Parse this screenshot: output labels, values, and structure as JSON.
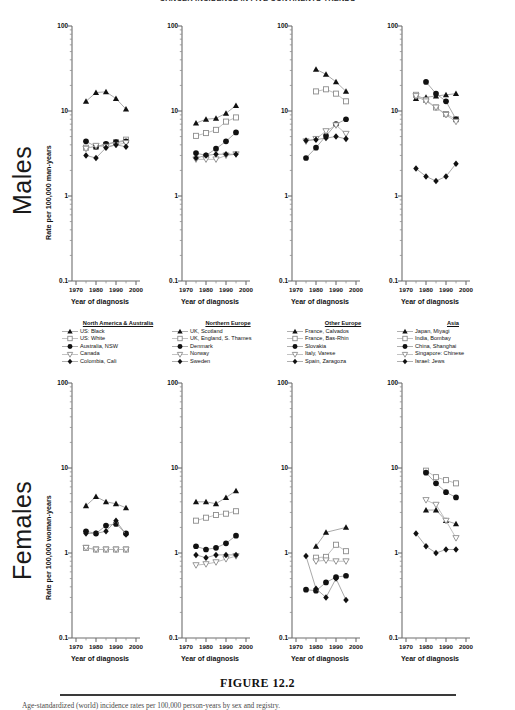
{
  "figure": {
    "top_title": "CANCER INCIDENCE IN FIVE CONTINENTS TRENDS",
    "caption": "FIGURE 12.2",
    "footnote": "Age-standardized (world) incidence rates per 100,000 person-years by sex and registry.",
    "row_labels": {
      "males": "Males",
      "females": "Females"
    },
    "y_axis_title_males": "Rate per 100,000 man-years",
    "y_axis_title_females": "Rate per 100,000 woman-years",
    "x_axis_title": "Year of diagnosis",
    "y_ticks": [
      "100",
      "10",
      "1",
      "0.1"
    ],
    "x_ticks": [
      "1970",
      "1980",
      "1990",
      "2000"
    ]
  },
  "legends": [
    {
      "id": "north-america-australia",
      "title": "North America & Australia",
      "entries": [
        {
          "label": "US: Black",
          "symbol": "filled-triangle"
        },
        {
          "label": "US: White",
          "symbol": "open-square"
        },
        {
          "label": "Australia, NSW",
          "symbol": "filled-circle"
        },
        {
          "label": "Canada",
          "symbol": "open-down-triangle"
        },
        {
          "label": "Colombia, Cali",
          "symbol": "filled-diamond"
        }
      ]
    },
    {
      "id": "northern-europe",
      "title": "Northern Europe",
      "entries": [
        {
          "label": "UK, Scotland",
          "symbol": "filled-triangle"
        },
        {
          "label": "UK, England, S. Thames",
          "symbol": "open-square"
        },
        {
          "label": "Denmark",
          "symbol": "filled-circle"
        },
        {
          "label": "Norway",
          "symbol": "open-down-triangle"
        },
        {
          "label": "Sweden",
          "symbol": "filled-diamond"
        }
      ]
    },
    {
      "id": "other-europe",
      "title": "Other Europe",
      "entries": [
        {
          "label": "France, Calvados",
          "symbol": "filled-triangle"
        },
        {
          "label": "France, Bas-Rhin",
          "symbol": "open-square"
        },
        {
          "label": "Slovakia",
          "symbol": "filled-circle"
        },
        {
          "label": "Italy, Varese",
          "symbol": "open-down-triangle"
        },
        {
          "label": "Spain, Zaragoza",
          "symbol": "filled-diamond"
        }
      ]
    },
    {
      "id": "asia",
      "title": "Asia",
      "entries": [
        {
          "label": "Japan, Miyagi",
          "symbol": "filled-triangle"
        },
        {
          "label": "India, Bombay",
          "symbol": "open-square"
        },
        {
          "label": "China, Shanghai",
          "symbol": "filled-circle"
        },
        {
          "label": "Singapore: Chinese",
          "symbol": "open-down-triangle"
        },
        {
          "label": "Israel: Jews",
          "symbol": "filled-diamond"
        }
      ]
    }
  ],
  "chart_data": {
    "type": "line",
    "log_y": true,
    "ylim": [
      0.1,
      100
    ],
    "xlim": [
      1968,
      2002
    ],
    "ylabel_males": "Rate per 100,000 man-years",
    "ylabel_females": "Rate per 100,000 woman-years",
    "xlabel": "Year of diagnosis",
    "y_ticks": [
      0.1,
      1,
      10,
      100
    ],
    "x_ticks": [
      1970,
      1980,
      1990,
      2000
    ],
    "grid": false,
    "legend_position": "below-top-row",
    "panels": [
      {
        "id": "males-north-america-australia",
        "sex": "Males",
        "region": "North America & Australia",
        "series": [
          {
            "name": "US: Black",
            "symbol": "filled-triangle",
            "x": [
              1975,
              1980,
              1985,
              1990,
              1995
            ],
            "values": [
              13.0,
              16.5,
              16.8,
              14.0,
              10.5
            ]
          },
          {
            "name": "US: White",
            "symbol": "open-square",
            "x": [
              1975,
              1980,
              1985,
              1990,
              1995
            ],
            "values": [
              3.7,
              3.8,
              4.0,
              4.3,
              4.6
            ]
          },
          {
            "name": "Australia, NSW",
            "symbol": "filled-circle",
            "x": [
              1975,
              1980,
              1985,
              1990,
              1995
            ],
            "values": [
              4.4,
              3.8,
              4.1,
              4.3,
              4.4
            ]
          },
          {
            "name": "Canada",
            "symbol": "open-down-triangle",
            "x": [
              1975,
              1980,
              1985,
              1990,
              1995
            ],
            "values": [
              3.6,
              3.9,
              3.8,
              4.0,
              4.2
            ]
          },
          {
            "name": "Colombia, Cali",
            "symbol": "filled-diamond",
            "x": [
              1975,
              1980,
              1985,
              1990,
              1995
            ],
            "values": [
              3.0,
              2.8,
              3.7,
              4.0,
              3.8
            ]
          }
        ]
      },
      {
        "id": "males-northern-europe",
        "sex": "Males",
        "region": "Northern Europe",
        "series": [
          {
            "name": "UK, Scotland",
            "symbol": "filled-triangle",
            "x": [
              1975,
              1980,
              1985,
              1990,
              1995
            ],
            "values": [
              7.2,
              8.0,
              8.2,
              9.4,
              11.6
            ]
          },
          {
            "name": "UK, England, S. Thames",
            "symbol": "open-square",
            "x": [
              1975,
              1980,
              1985,
              1990,
              1995
            ],
            "values": [
              5.1,
              5.5,
              6.0,
              7.5,
              8.4
            ]
          },
          {
            "name": "Denmark",
            "symbol": "filled-circle",
            "x": [
              1975,
              1980,
              1985,
              1990,
              1995
            ],
            "values": [
              3.2,
              3.0,
              3.6,
              4.4,
              5.6
            ]
          },
          {
            "name": "Norway",
            "symbol": "open-down-triangle",
            "x": [
              1975,
              1980,
              1985,
              1990,
              1995
            ],
            "values": [
              2.7,
              2.7,
              2.7,
              3.0,
              3.1
            ]
          },
          {
            "name": "Sweden",
            "symbol": "filled-diamond",
            "x": [
              1975,
              1980,
              1985,
              1990,
              1995
            ],
            "values": [
              2.8,
              3.0,
              3.1,
              3.1,
              3.1
            ]
          }
        ]
      },
      {
        "id": "males-other-europe",
        "sex": "Males",
        "region": "Other Europe",
        "series": [
          {
            "name": "France, Calvados",
            "symbol": "filled-triangle",
            "x": [
              1980,
              1985,
              1990,
              1995
            ],
            "values": [
              31.0,
              27.0,
              22.0,
              17.0
            ]
          },
          {
            "name": "France, Bas-Rhin",
            "symbol": "open-square",
            "x": [
              1980,
              1985,
              1990,
              1995
            ],
            "values": [
              17.0,
              18.0,
              16.0,
              13.0
            ]
          },
          {
            "name": "Slovakia",
            "symbol": "filled-circle",
            "x": [
              1975,
              1980,
              1985,
              1990,
              1995
            ],
            "values": [
              2.8,
              3.7,
              5.1,
              7.0,
              8.0
            ]
          },
          {
            "name": "Italy, Varese",
            "symbol": "open-down-triangle",
            "x": [
              1975,
              1980,
              1985,
              1990,
              1995
            ],
            "values": [
              4.4,
              4.7,
              5.8,
              6.8,
              5.4
            ]
          },
          {
            "name": "Spain, Zaragoza",
            "symbol": "filled-diamond",
            "x": [
              1975,
              1980,
              1985,
              1990,
              1995
            ],
            "values": [
              4.5,
              4.6,
              4.8,
              5.0,
              4.7
            ]
          }
        ]
      },
      {
        "id": "males-asia",
        "sex": "Males",
        "region": "Asia",
        "series": [
          {
            "name": "Japan, Miyagi",
            "symbol": "filled-triangle",
            "x": [
              1975,
              1980,
              1985,
              1990,
              1995
            ],
            "values": [
              14.0,
              14.5,
              15.0,
              15.5,
              16.0
            ]
          },
          {
            "name": "India, Bombay",
            "symbol": "open-square",
            "x": [
              1975,
              1980,
              1985,
              1990,
              1995
            ],
            "values": [
              15.5,
              13.5,
              11.0,
              9.2,
              8.0
            ]
          },
          {
            "name": "China, Shanghai",
            "symbol": "filled-circle",
            "x": [
              1980,
              1985,
              1990,
              1995
            ],
            "values": [
              22.0,
              16.0,
              13.0,
              8.0
            ]
          },
          {
            "name": "Singapore: Chinese",
            "symbol": "open-down-triangle",
            "x": [
              1975,
              1980,
              1985,
              1990,
              1995
            ],
            "values": [
              15.0,
              13.0,
              11.0,
              9.0,
              7.5
            ]
          },
          {
            "name": "Israel: Jews",
            "symbol": "filled-diamond",
            "x": [
              1975,
              1980,
              1985,
              1990,
              1995
            ],
            "values": [
              2.1,
              1.7,
              1.5,
              1.7,
              2.4
            ]
          }
        ]
      },
      {
        "id": "females-north-america-australia",
        "sex": "Females",
        "region": "North America & Australia",
        "series": [
          {
            "name": "US: Black",
            "symbol": "filled-triangle",
            "x": [
              1975,
              1980,
              1985,
              1990,
              1995
            ],
            "values": [
              3.6,
              4.6,
              4.0,
              3.8,
              3.4
            ]
          },
          {
            "name": "US: White",
            "symbol": "open-square",
            "x": [
              1975,
              1980,
              1985,
              1990,
              1995
            ],
            "values": [
              1.15,
              1.1,
              1.1,
              1.1,
              1.1
            ]
          },
          {
            "name": "Australia, NSW",
            "symbol": "filled-circle",
            "x": [
              1975,
              1980,
              1985,
              1990,
              1995
            ],
            "values": [
              1.8,
              1.7,
              2.1,
              2.2,
              1.7
            ]
          },
          {
            "name": "Canada",
            "symbol": "open-down-triangle",
            "x": [
              1975,
              1980,
              1985,
              1990,
              1995
            ],
            "values": [
              1.15,
              1.1,
              1.1,
              1.1,
              1.1
            ]
          },
          {
            "name": "Colombia, Cali",
            "symbol": "filled-diamond",
            "x": [
              1975,
              1980,
              1985,
              1990,
              1995
            ],
            "values": [
              1.7,
              1.7,
              1.8,
              2.4,
              1.65
            ]
          }
        ]
      },
      {
        "id": "females-northern-europe",
        "sex": "Females",
        "region": "Northern Europe",
        "series": [
          {
            "name": "UK, Scotland",
            "symbol": "filled-triangle",
            "x": [
              1975,
              1980,
              1985,
              1990,
              1995
            ],
            "values": [
              4.0,
              4.0,
              3.8,
              4.5,
              5.4
            ]
          },
          {
            "name": "UK, England, S. Thames",
            "symbol": "open-square",
            "x": [
              1975,
              1980,
              1985,
              1990,
              1995
            ],
            "values": [
              2.4,
              2.6,
              2.8,
              2.9,
              3.1
            ]
          },
          {
            "name": "Denmark",
            "symbol": "filled-circle",
            "x": [
              1975,
              1980,
              1985,
              1990,
              1995
            ],
            "values": [
              1.2,
              1.1,
              1.15,
              1.3,
              1.6
            ]
          },
          {
            "name": "Norway",
            "symbol": "open-down-triangle",
            "x": [
              1975,
              1980,
              1985,
              1990,
              1995
            ],
            "values": [
              0.72,
              0.74,
              0.78,
              0.85,
              0.92
            ]
          },
          {
            "name": "Sweden",
            "symbol": "filled-diamond",
            "x": [
              1975,
              1980,
              1985,
              1990,
              1995
            ],
            "values": [
              0.95,
              0.88,
              0.95,
              0.95,
              0.95
            ]
          }
        ]
      },
      {
        "id": "females-other-europe",
        "sex": "Females",
        "region": "Other Europe",
        "series": [
          {
            "name": "France, Calvados",
            "symbol": "filled-triangle",
            "x": [
              1980,
              1985,
              1995
            ],
            "values": [
              1.2,
              1.75,
              2.0
            ]
          },
          {
            "name": "France, Bas-Rhin",
            "symbol": "open-square",
            "x": [
              1980,
              1985,
              1990,
              1995
            ],
            "values": [
              0.88,
              0.9,
              1.25,
              1.05
            ]
          },
          {
            "name": "Slovakia",
            "symbol": "filled-circle",
            "x": [
              1975,
              1980,
              1985,
              1990,
              1995
            ],
            "values": [
              0.37,
              0.36,
              0.45,
              0.52,
              0.54
            ]
          },
          {
            "name": "Italy, Varese",
            "symbol": "open-down-triangle",
            "x": [
              1980,
              1985,
              1990,
              1995
            ],
            "values": [
              0.8,
              0.82,
              0.8,
              0.8
            ]
          },
          {
            "name": "Spain, Zaragoza",
            "symbol": "filled-diamond",
            "x": [
              1975,
              1980,
              1985,
              1990,
              1995
            ],
            "values": [
              0.92,
              0.38,
              0.3,
              0.5,
              0.28
            ]
          }
        ]
      },
      {
        "id": "females-asia",
        "sex": "Females",
        "region": "Asia",
        "series": [
          {
            "name": "Japan, Miyagi",
            "symbol": "filled-triangle",
            "x": [
              1980,
              1985,
              1990,
              1995
            ],
            "values": [
              3.2,
              3.2,
              2.4,
              2.2
            ]
          },
          {
            "name": "India, Bombay",
            "symbol": "open-square",
            "x": [
              1980,
              1985,
              1990,
              1995
            ],
            "values": [
              9.3,
              7.8,
              7.2,
              6.6
            ]
          },
          {
            "name": "China, Shanghai",
            "symbol": "filled-circle",
            "x": [
              1980,
              1985,
              1990,
              1995
            ],
            "values": [
              8.8,
              6.6,
              5.2,
              4.5
            ]
          },
          {
            "name": "Singapore: Chinese",
            "symbol": "open-down-triangle",
            "x": [
              1980,
              1985,
              1990,
              1995
            ],
            "values": [
              4.2,
              3.7,
              2.4,
              1.5
            ]
          },
          {
            "name": "Israel: Jews",
            "symbol": "filled-diamond",
            "x": [
              1975,
              1980,
              1985,
              1990,
              1995
            ],
            "values": [
              1.7,
              1.2,
              1.0,
              1.1,
              1.1
            ]
          }
        ]
      }
    ]
  }
}
